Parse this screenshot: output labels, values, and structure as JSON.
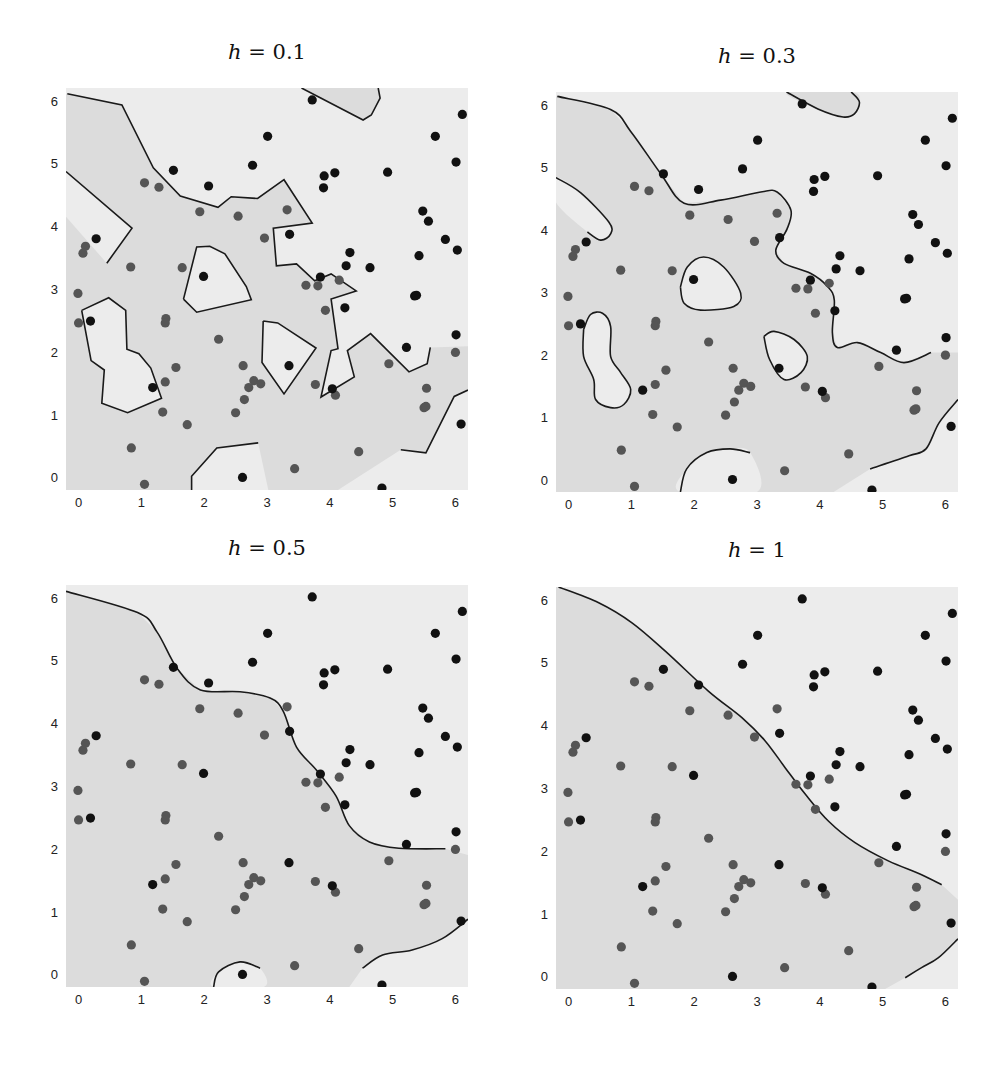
{
  "figure": {
    "colors": {
      "light_region": "#ececec",
      "dark_region": "#dcdcdc",
      "boundary": "#1a1a1a",
      "class1_point": "#111111",
      "class0_point": "#555555"
    }
  },
  "chart_data": [
    {
      "type": "scatter",
      "title": "h = 0.1",
      "title_var": "h",
      "title_value": "= 0.1",
      "xlabel": "",
      "ylabel": "",
      "xlim": [
        -0.2,
        6.2
      ],
      "ylim": [
        -0.2,
        6.2
      ],
      "xticks": [
        "0",
        "1",
        "2",
        "3",
        "4",
        "5",
        "6"
      ],
      "yticks": [
        "0",
        "1",
        "2",
        "3",
        "4",
        "5",
        "6"
      ],
      "grid": false,
      "dark_region": [
        [
          -0.18,
          6.11
        ],
        [
          0.69,
          5.93
        ],
        [
          1.19,
          4.93
        ],
        [
          1.62,
          4.48
        ],
        [
          2.22,
          4.3
        ],
        [
          2.43,
          4.47
        ],
        [
          2.85,
          4.44
        ],
        [
          3.27,
          4.74
        ],
        [
          3.72,
          4.05
        ],
        [
          3.1,
          3.97
        ],
        [
          3.15,
          3.37
        ],
        [
          3.47,
          3.4
        ],
        [
          3.76,
          3.13
        ],
        [
          4.02,
          3.24
        ],
        [
          4.42,
          2.97
        ],
        [
          4.02,
          2.84
        ],
        [
          4.13,
          2.05
        ],
        [
          4.02,
          2.02
        ],
        [
          3.86,
          1.28
        ],
        [
          4.39,
          1.6
        ],
        [
          4.28,
          2.02
        ],
        [
          4.65,
          2.29
        ],
        [
          5.26,
          1.68
        ],
        [
          5.55,
          1.81
        ],
        [
          5.6,
          2.07
        ],
        [
          6.2,
          2.09
        ],
        [
          6.2,
          1.39
        ],
        [
          5.98,
          1.29
        ],
        [
          5.53,
          0.39
        ],
        [
          5.13,
          0.44
        ],
        [
          4.13,
          -0.2
        ],
        [
          -0.2,
          -0.2
        ],
        [
          -0.2,
          6.11
        ]
      ],
      "dark_islands": [
        [
          [
            3.55,
            6.2
          ],
          [
            4.77,
            6.2
          ],
          [
            4.8,
            6.04
          ],
          [
            4.66,
            5.77
          ],
          [
            4.53,
            5.69
          ]
        ]
      ],
      "light_islands": [
        [
          [
            -0.2,
            4.87
          ],
          [
            0.85,
            3.97
          ],
          [
            0.45,
            3.41
          ],
          [
            -0.2,
            4.15
          ]
        ],
        [
          [
            0.05,
            2.66
          ],
          [
            0.48,
            2.86
          ],
          [
            0.75,
            2.66
          ],
          [
            0.77,
            2.04
          ],
          [
            0.96,
            1.97
          ],
          [
            1.15,
            1.74
          ],
          [
            1.32,
            1.26
          ],
          [
            0.78,
            1.03
          ],
          [
            0.37,
            1.18
          ],
          [
            0.41,
            1.71
          ],
          [
            0.2,
            1.86
          ]
        ],
        [
          [
            1.67,
            2.84
          ],
          [
            1.88,
            3.67
          ],
          [
            2.09,
            3.68
          ],
          [
            2.33,
            3.56
          ],
          [
            2.67,
            3.04
          ],
          [
            2.75,
            2.83
          ],
          [
            1.88,
            2.63
          ]
        ],
        [
          [
            2.94,
            2.49
          ],
          [
            3.17,
            2.46
          ],
          [
            3.78,
            2.06
          ],
          [
            3.27,
            1.33
          ],
          [
            2.92,
            1.83
          ]
        ],
        [
          [
            1.8,
            -0.2
          ],
          [
            1.8,
            0.02
          ],
          [
            2.2,
            0.47
          ],
          [
            2.86,
            0.55
          ],
          [
            3.02,
            -0.2
          ]
        ]
      ],
      "smooth": false
    },
    {
      "type": "scatter",
      "title": "h = 0.3",
      "title_var": "h",
      "title_value": "= 0.3",
      "xlabel": "",
      "ylabel": "",
      "xlim": [
        -0.2,
        6.2
      ],
      "ylim": [
        -0.2,
        6.2
      ],
      "xticks": [
        "0",
        "1",
        "2",
        "3",
        "4",
        "5",
        "6"
      ],
      "yticks": [
        "0",
        "1",
        "2",
        "3",
        "4",
        "5",
        "6"
      ],
      "grid": false,
      "dark_region": [
        [
          -0.18,
          6.13
        ],
        [
          0.67,
          5.92
        ],
        [
          0.99,
          5.57
        ],
        [
          1.47,
          4.89
        ],
        [
          1.84,
          4.42
        ],
        [
          2.42,
          4.47
        ],
        [
          3.06,
          4.6
        ],
        [
          3.32,
          4.6
        ],
        [
          3.54,
          4.31
        ],
        [
          3.48,
          4.01
        ],
        [
          3.3,
          3.67
        ],
        [
          3.43,
          3.46
        ],
        [
          3.85,
          3.3
        ],
        [
          4.12,
          3.09
        ],
        [
          4.23,
          2.87
        ],
        [
          4.2,
          2.35
        ],
        [
          4.28,
          2.11
        ],
        [
          4.6,
          2.19
        ],
        [
          4.97,
          2.03
        ],
        [
          5.34,
          1.87
        ],
        [
          5.77,
          2.03
        ],
        [
          6.2,
          2.03
        ],
        [
          6.2,
          1.28
        ],
        [
          5.9,
          0.91
        ],
        [
          5.69,
          0.49
        ],
        [
          5.42,
          0.38
        ],
        [
          4.8,
          0.17
        ],
        [
          4.22,
          -0.2
        ],
        [
          -0.2,
          -0.2
        ],
        [
          -0.2,
          6.13
        ]
      ],
      "dark_islands": [
        [
          [
            3.47,
            6.2
          ],
          [
            4.5,
            6.2
          ],
          [
            4.63,
            6.04
          ],
          [
            4.55,
            5.85
          ],
          [
            4.37,
            5.8
          ],
          [
            3.97,
            5.93
          ]
        ]
      ],
      "light_islands": [
        [
          [
            -0.2,
            4.83
          ],
          [
            0.19,
            4.59
          ],
          [
            0.64,
            4.12
          ],
          [
            0.67,
            3.93
          ],
          [
            0.51,
            3.83
          ],
          [
            0.3,
            3.96
          ],
          [
            -0.2,
            4.43
          ]
        ],
        [
          [
            0.24,
            2.4
          ],
          [
            0.35,
            2.64
          ],
          [
            0.54,
            2.66
          ],
          [
            0.67,
            2.45
          ],
          [
            0.67,
            1.97
          ],
          [
            0.83,
            1.71
          ],
          [
            0.99,
            1.44
          ],
          [
            0.88,
            1.2
          ],
          [
            0.67,
            1.15
          ],
          [
            0.43,
            1.28
          ],
          [
            0.4,
            1.6
          ],
          [
            0.24,
            1.97
          ]
        ],
        [
          [
            1.78,
            3.08
          ],
          [
            1.89,
            3.4
          ],
          [
            2.15,
            3.56
          ],
          [
            2.47,
            3.4
          ],
          [
            2.74,
            2.98
          ],
          [
            2.63,
            2.77
          ],
          [
            2.1,
            2.71
          ],
          [
            1.84,
            2.82
          ]
        ],
        [
          [
            3.11,
            2.29
          ],
          [
            3.27,
            2.37
          ],
          [
            3.59,
            2.24
          ],
          [
            3.8,
            1.97
          ],
          [
            3.7,
            1.71
          ],
          [
            3.43,
            1.6
          ],
          [
            3.2,
            1.92
          ]
        ],
        [
          [
            1.78,
            -0.2
          ],
          [
            1.88,
            0.17
          ],
          [
            2.2,
            0.43
          ],
          [
            2.57,
            0.49
          ],
          [
            2.89,
            0.43
          ],
          [
            3.0,
            -0.2
          ]
        ]
      ],
      "smooth": true
    },
    {
      "type": "scatter",
      "title": "h = 0.5",
      "title_var": "h",
      "title_value": "= 0.5",
      "xlabel": "",
      "ylabel": "",
      "xlim": [
        -0.2,
        6.2
      ],
      "ylim": [
        -0.2,
        6.2
      ],
      "xticks": [
        "0",
        "1",
        "2",
        "3",
        "4",
        "5",
        "6"
      ],
      "yticks": [
        "0",
        "1",
        "2",
        "3",
        "4",
        "5",
        "6"
      ],
      "grid": false,
      "dark_region": [
        [
          -0.2,
          6.1
        ],
        [
          0.94,
          5.76
        ],
        [
          1.25,
          5.45
        ],
        [
          1.57,
          4.87
        ],
        [
          1.94,
          4.53
        ],
        [
          2.57,
          4.5
        ],
        [
          3.05,
          4.4
        ],
        [
          3.26,
          4.19
        ],
        [
          3.47,
          3.62
        ],
        [
          3.79,
          3.25
        ],
        [
          4.1,
          2.84
        ],
        [
          4.31,
          2.37
        ],
        [
          4.63,
          2.11
        ],
        [
          5.1,
          2.01
        ],
        [
          5.84,
          2.0
        ],
        [
          6.2,
          1.9
        ],
        [
          6.2,
          0.88
        ],
        [
          5.79,
          0.57
        ],
        [
          5.31,
          0.39
        ],
        [
          4.84,
          0.31
        ],
        [
          4.52,
          0.1
        ],
        [
          4.31,
          -0.2
        ],
        [
          -0.2,
          -0.2
        ]
      ],
      "dark_islands": [],
      "light_islands": [
        [
          [
            2.15,
            -0.2
          ],
          [
            2.23,
            0.04
          ],
          [
            2.57,
            0.2
          ],
          [
            2.89,
            0.1
          ],
          [
            2.95,
            -0.2
          ]
        ]
      ],
      "smooth": true
    },
    {
      "type": "scatter",
      "title": "h = 1",
      "title_var": "h",
      "title_value": "= 1",
      "xlabel": "",
      "ylabel": "",
      "xlim": [
        -0.2,
        6.2
      ],
      "ylim": [
        -0.2,
        6.2
      ],
      "xticks": [
        "0",
        "1",
        "2",
        "3",
        "4",
        "5",
        "6"
      ],
      "yticks": [
        "0",
        "1",
        "2",
        "3",
        "4",
        "5",
        "6"
      ],
      "grid": false,
      "dark_region": [
        [
          -0.16,
          6.2
        ],
        [
          0.48,
          5.95
        ],
        [
          1.01,
          5.63
        ],
        [
          1.54,
          5.18
        ],
        [
          2.23,
          4.54
        ],
        [
          2.76,
          4.12
        ],
        [
          3.13,
          3.75
        ],
        [
          3.45,
          3.32
        ],
        [
          3.77,
          2.9
        ],
        [
          4.14,
          2.47
        ],
        [
          4.56,
          2.13
        ],
        [
          5.09,
          1.84
        ],
        [
          5.62,
          1.62
        ],
        [
          5.94,
          1.46
        ],
        [
          6.2,
          1.22
        ],
        [
          6.2,
          0.6
        ],
        [
          5.89,
          0.3
        ],
        [
          5.62,
          0.14
        ],
        [
          5.36,
          -0.02
        ],
        [
          5.04,
          -0.2
        ],
        [
          -0.2,
          -0.2
        ],
        [
          -0.2,
          6.2
        ]
      ],
      "dark_islands": [],
      "light_islands": [],
      "smooth": true
    }
  ],
  "points": {
    "class1": [
      [
        3.72,
        6.01
      ],
      [
        6.11,
        5.78
      ],
      [
        3.01,
        5.43
      ],
      [
        5.68,
        5.43
      ],
      [
        6.01,
        5.02
      ],
      [
        1.51,
        4.89
      ],
      [
        2.77,
        4.97
      ],
      [
        3.91,
        4.8
      ],
      [
        4.08,
        4.85
      ],
      [
        4.92,
        4.86
      ],
      [
        2.07,
        4.64
      ],
      [
        3.9,
        4.61
      ],
      [
        5.48,
        4.24
      ],
      [
        5.57,
        4.08
      ],
      [
        3.36,
        3.87
      ],
      [
        0.28,
        3.8
      ],
      [
        5.84,
        3.79
      ],
      [
        6.03,
        3.62
      ],
      [
        4.32,
        3.58
      ],
      [
        5.42,
        3.53
      ],
      [
        4.26,
        3.37
      ],
      [
        4.64,
        3.34
      ],
      [
        1.99,
        3.2
      ],
      [
        3.85,
        3.19
      ],
      [
        5.35,
        2.89
      ],
      [
        5.38,
        2.9
      ],
      [
        0.19,
        2.49
      ],
      [
        4.24,
        2.7
      ],
      [
        6.01,
        2.27
      ],
      [
        5.22,
        2.07
      ],
      [
        3.35,
        1.78
      ],
      [
        1.18,
        1.43
      ],
      [
        4.04,
        1.41
      ],
      [
        6.09,
        0.85
      ],
      [
        2.61,
        0.0
      ],
      [
        4.83,
        -0.17
      ]
    ],
    "class0": [
      [
        1.05,
        4.69
      ],
      [
        1.28,
        4.62
      ],
      [
        1.93,
        4.23
      ],
      [
        2.54,
        4.16
      ],
      [
        3.32,
        4.26
      ],
      [
        2.96,
        3.81
      ],
      [
        0.11,
        3.68
      ],
      [
        0.07,
        3.57
      ],
      [
        0.83,
        3.35
      ],
      [
        1.65,
        3.34
      ],
      [
        -0.01,
        2.93
      ],
      [
        3.62,
        3.06
      ],
      [
        3.81,
        3.05
      ],
      [
        4.15,
        3.14
      ],
      [
        0.0,
        2.46
      ],
      [
        3.93,
        2.66
      ],
      [
        1.39,
        2.53
      ],
      [
        1.38,
        2.46
      ],
      [
        2.23,
        2.2
      ],
      [
        6.0,
        1.99
      ],
      [
        4.94,
        1.81
      ],
      [
        1.55,
        1.75
      ],
      [
        2.62,
        1.78
      ],
      [
        1.38,
        1.52
      ],
      [
        2.79,
        1.54
      ],
      [
        2.9,
        1.49
      ],
      [
        2.71,
        1.43
      ],
      [
        3.77,
        1.48
      ],
      [
        4.09,
        1.31
      ],
      [
        5.54,
        1.42
      ],
      [
        2.64,
        1.24
      ],
      [
        1.34,
        1.04
      ],
      [
        2.5,
        1.03
      ],
      [
        5.5,
        1.11
      ],
      [
        5.53,
        1.13
      ],
      [
        1.73,
        0.84
      ],
      [
        0.84,
        0.47
      ],
      [
        4.46,
        0.41
      ],
      [
        3.44,
        0.14
      ],
      [
        1.05,
        -0.11
      ]
    ]
  }
}
